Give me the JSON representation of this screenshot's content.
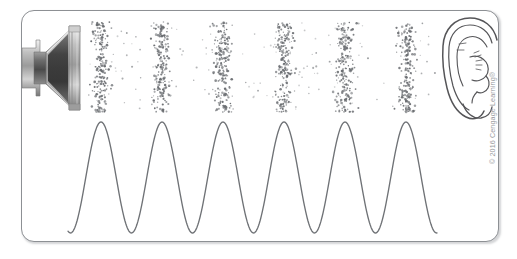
{
  "figure": {
    "name": "sound-wave-propagation-diagram",
    "frame": {
      "x": 21,
      "y": 10,
      "width": 478,
      "height": 232,
      "corner_radius": 13,
      "border_color": "#8d9094",
      "background_color": "#ffffff"
    },
    "credit": "© 2016 Cengage Learning®"
  },
  "colors": {
    "page_background": "#ffffff",
    "frame_border": "#8d9094",
    "wave_stroke": "#6f7276",
    "dot_fill": "#6b6e72",
    "speaker_dark": "#3f3f3f",
    "speaker_mid": "#9a9a9a",
    "speaker_light": "#dcdcdc",
    "ear_stroke": "#555558",
    "credit_text": "#96999d"
  },
  "speaker": {
    "name": "loudspeaker",
    "label": "loudspeaker",
    "x": 20,
    "y": 26,
    "width": 62,
    "height": 84
  },
  "ear": {
    "name": "human-ear",
    "label": "human ear",
    "x": 443,
    "y": 18,
    "width": 62,
    "height": 104
  },
  "dot_field": {
    "name": "air-particle-field",
    "label": "air particles showing compressions and rarefactions",
    "region": {
      "x": 84,
      "y": 22,
      "width": 352,
      "height": 90
    },
    "band_count": 6,
    "band_centers_x": [
      101,
      162,
      223,
      284,
      345,
      407
    ],
    "band_half_width": 15,
    "dense_dots_per_band": 190,
    "sparse_dots_total": 150,
    "dot_radius_min": 0.55,
    "dot_radius_max": 1.35,
    "compression_label": "compression",
    "rarefaction_label": "rarefaction"
  },
  "chart_data": {
    "type": "line",
    "subtitle": "Sinusoidal pressure variation aligned with the compressions above",
    "xlabel": "",
    "ylabel": "",
    "x": [
      68,
      101,
      131,
      162,
      192,
      223,
      253,
      284,
      315,
      345,
      376,
      407,
      437
    ],
    "values": [
      -1,
      1,
      -1,
      1,
      -1,
      1,
      -1,
      1,
      -1,
      1,
      -1,
      1,
      -1
    ],
    "series": [
      {
        "name": "pressure",
        "values": [
          -1,
          1,
          -1,
          1,
          -1,
          1,
          -1,
          1,
          -1,
          1,
          -1,
          1,
          -1
        ]
      }
    ],
    "cycles": 6,
    "wavelength_px": 61,
    "peak_y_px": 122,
    "trough_y_px": 233,
    "baseline_y_px": 177.5,
    "amplitude_px": 55.5,
    "start_x_px": 68,
    "end_x_px": 437,
    "xlim": [
      68,
      437
    ],
    "ylim": [
      -1,
      1
    ],
    "grid": false,
    "legend": "none",
    "stroke_color": "#6f7276",
    "stroke_width": 1.35,
    "peaks_x": [
      101,
      162,
      223,
      284,
      345,
      407
    ],
    "troughs_x": [
      131,
      192,
      253,
      315,
      376
    ],
    "peak_aligned_with": "compression bands"
  }
}
